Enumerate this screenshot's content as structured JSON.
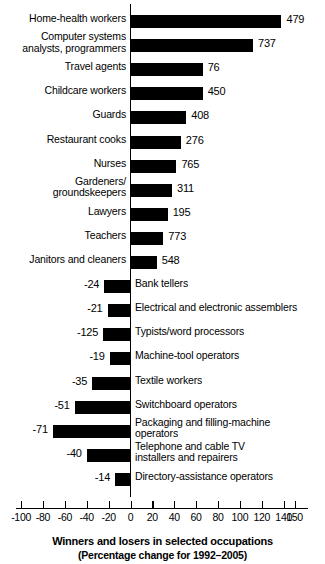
{
  "chart_data": {
    "type": "bar",
    "orientation": "horizontal",
    "title": "Winners and losers in selected occupations",
    "subtitle": "(Percentage change for 1992–2005)",
    "xlabel": "",
    "ylabel": "",
    "xlim": [
      -100,
      150
    ],
    "grid": false,
    "legend": null,
    "axis_ticks": [
      -100,
      -80,
      -60,
      -40,
      -20,
      0,
      20,
      40,
      60,
      80,
      100,
      120,
      140,
      150
    ],
    "axis_tick_labels": [
      "-100",
      "-80",
      "-60",
      "-40",
      "-20",
      "0",
      "20",
      "40",
      "60",
      "80",
      "100",
      "120",
      "140",
      "150"
    ],
    "categories": [
      "Home-health workers",
      "Computer systems\nanalysts, programmers",
      "Travel agents",
      "Childcare workers",
      "Guards",
      "Restaurant cooks",
      "Nurses",
      "Gardeners/\ngroundskeepers",
      "Lawyers",
      "Teachers",
      "Janitors and cleaners",
      "Bank tellers",
      "Electrical and electronic assemblers",
      "Typists/word processors",
      "Machine-tool operators",
      "Textile workers",
      "Switchboard operators",
      "Packaging and filling-machine\noperators",
      "Telephone and cable TV\ninstallers and repairers",
      "Directory-assistance operators"
    ],
    "values": [
      138,
      112,
      66,
      66,
      51,
      46,
      42,
      38,
      34,
      30,
      24,
      -24,
      -21,
      -25,
      -19,
      -35,
      -51,
      -71,
      -40,
      -14
    ],
    "data_labels": [
      "479",
      "737",
      "76",
      "450",
      "408",
      "276",
      "765",
      "311",
      "195",
      "773",
      "548",
      "-24",
      "-21",
      "-125",
      "-19",
      "-35",
      "-51",
      "-71",
      "-40",
      "-14"
    ],
    "label_side": [
      "right",
      "right",
      "right",
      "right",
      "right",
      "right",
      "right",
      "right",
      "right",
      "right",
      "right",
      "left",
      "left",
      "left",
      "left",
      "left",
      "left",
      "left",
      "left",
      "left"
    ]
  },
  "colors": {
    "bar": "#000000",
    "axis": "#000000",
    "background": "#ffffff",
    "text": "#000000"
  }
}
